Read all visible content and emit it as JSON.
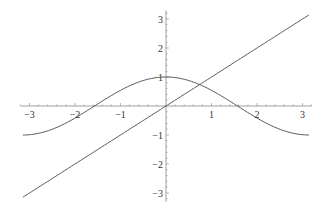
{
  "chart_data": {
    "type": "line",
    "title": "",
    "xlabel": "",
    "ylabel": "",
    "xlim": [
      -3.2,
      3.2
    ],
    "ylim": [
      -3.3,
      3.3
    ],
    "grid": false,
    "legend": null,
    "x_ticks": [
      -3,
      -2,
      -1,
      1,
      2,
      3
    ],
    "y_ticks": [
      -3,
      -2,
      -1,
      1,
      2,
      3
    ],
    "x_tick_labels": [
      "−3",
      "−2",
      "−1",
      "1",
      "2",
      "3"
    ],
    "y_tick_labels": [
      "−3",
      "−2",
      "−1",
      "1",
      "2",
      "3"
    ],
    "series": [
      {
        "name": "cos(x)",
        "function": "cos(x)",
        "domain": [
          -3.14159,
          3.14159
        ],
        "color": "#444444"
      },
      {
        "name": "x",
        "function": "x",
        "domain": [
          -3.14159,
          3.14159
        ],
        "color": "#444444"
      }
    ],
    "annotations": []
  },
  "layout": {
    "origin_px": [
      166,
      106
    ],
    "x_scale": 45.5,
    "y_scale": 29.0,
    "axis_color": "#888888",
    "line_color": "#444444"
  }
}
